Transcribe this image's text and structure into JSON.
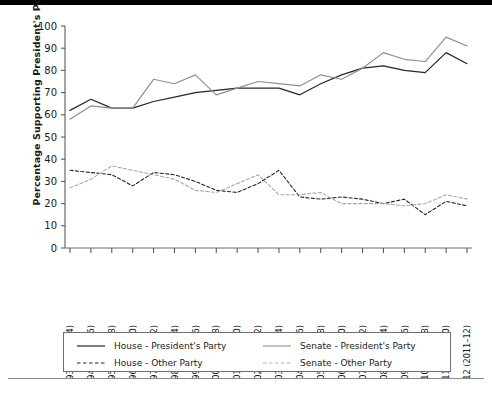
{
  "figure": {
    "top_rule_color": "#000000",
    "bottom_rule_color": "#8a8a8a"
  },
  "chart_data": {
    "type": "line",
    "title": "",
    "subtitle": "",
    "xlabel": "",
    "ylabel": "Percentage Supporting President's Position",
    "ylim": [
      0,
      100
    ],
    "yticks": [
      0,
      10,
      20,
      30,
      40,
      50,
      60,
      70,
      80,
      90,
      100
    ],
    "grid": false,
    "legend_position": "bottom",
    "categories": [
      "93 (1973–74)",
      "94 (1975–76)",
      "95 (1977–78)",
      "96 (1979–80)",
      "97 (1981–82)",
      "98 (1983–84)",
      "99 (1985–86)",
      "100 (1987–88)",
      "101 (1989–90)",
      "102 (1991–92)",
      "103 (1993–94)",
      "104 (1995–96)",
      "105 (1997–98)",
      "106 (1999–00)",
      "107 (2001–02)",
      "108 (2003–04)",
      "109 (2005–06)",
      "110 (2007–08)",
      "111 (2009–10)",
      "112 (2011–12)"
    ],
    "series": [
      {
        "name": "House - President's Party",
        "color": "#262626",
        "dash": "solid",
        "values": [
          62,
          67,
          63,
          63,
          66,
          68,
          70,
          71,
          72,
          72,
          72,
          69,
          74,
          78,
          81,
          82,
          80,
          79,
          88,
          83
        ]
      },
      {
        "name": "Senate - President's Party",
        "color": "#8f8f8f",
        "dash": "solid",
        "values": [
          58,
          64,
          63,
          63,
          76,
          74,
          78,
          69,
          72,
          75,
          74,
          73,
          78,
          76,
          81,
          88,
          85,
          84,
          95,
          91
        ]
      },
      {
        "name": "House - Other Party",
        "color": "#262626",
        "dash": "dashed",
        "values": [
          35,
          34,
          33,
          28,
          34,
          33,
          30,
          26,
          25,
          29,
          35,
          23,
          22,
          23,
          22,
          20,
          22,
          15,
          21,
          19
        ]
      },
      {
        "name": "Senate - Other Party",
        "color": "#a8a8a8",
        "dash": "dashed",
        "values": [
          27,
          31,
          37,
          35,
          33,
          31,
          26,
          25,
          29,
          33,
          24,
          24,
          25,
          20,
          20,
          20,
          19,
          20,
          24,
          22
        ]
      }
    ]
  },
  "legend": {
    "entries": [
      {
        "label": "House - President's Party",
        "icon": "solid-dark-line-icon"
      },
      {
        "label": "Senate - President's Party",
        "icon": "solid-gray-line-icon"
      },
      {
        "label": "House - Other Party",
        "icon": "dashed-dark-line-icon"
      },
      {
        "label": "Senate - Other Party",
        "icon": "dashed-gray-line-icon"
      }
    ]
  }
}
